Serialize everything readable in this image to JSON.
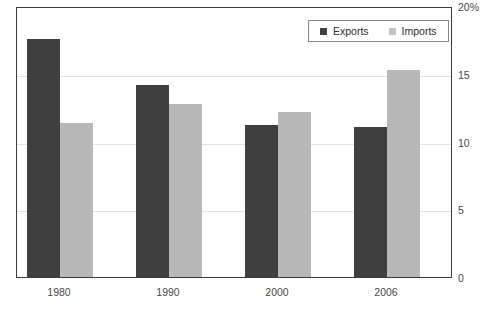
{
  "chart_data": {
    "type": "bar",
    "title": "",
    "xlabel": "",
    "ylabel": "",
    "categories": [
      "1980",
      "1990",
      "2000",
      "2006"
    ],
    "series": [
      {
        "name": "Exports",
        "color": "#3f3f3f",
        "values": [
          17.6,
          14.2,
          11.2,
          11.1
        ]
      },
      {
        "name": "Imports",
        "color": "#b8b8b8",
        "values": [
          11.4,
          12.8,
          12.2,
          15.3
        ]
      }
    ],
    "ylim": [
      0,
      20
    ],
    "yticks": [
      0,
      5,
      10,
      15,
      20
    ],
    "ytick_labels": [
      "0",
      "5",
      "10",
      "15",
      "20%"
    ],
    "grid": true,
    "grid_color": "#e4e4e4",
    "legend_position": "top-right",
    "axis_unit": "percent",
    "y_axis_side": "right"
  },
  "legend": {
    "items": [
      {
        "label": "Exports",
        "swatch": "legend-swatch-exports"
      },
      {
        "label": "Imports",
        "swatch": "legend-swatch-imports"
      }
    ]
  },
  "title_remnant": ""
}
